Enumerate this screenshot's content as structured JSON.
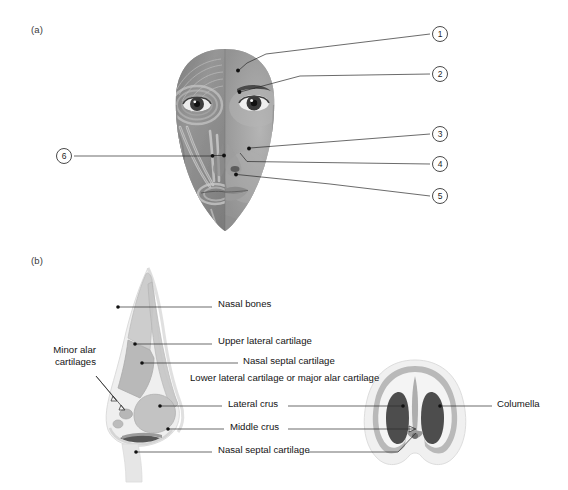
{
  "figure": {
    "panels": [
      {
        "id": "a",
        "letter": "(a)"
      },
      {
        "id": "b",
        "letter": "(b)"
      }
    ]
  },
  "panel_a": {
    "letter": "(a)",
    "description": "Anterior view of the face, left half showing facial musculature and right half showing skin surface",
    "callouts": [
      {
        "number": "1",
        "circle": {
          "x": 440,
          "y": 34
        },
        "dot": {
          "x": 237,
          "y": 70
        }
      },
      {
        "number": "2",
        "circle": {
          "x": 440,
          "y": 74
        },
        "dot": {
          "x": 238,
          "y": 92
        }
      },
      {
        "number": "3",
        "circle": {
          "x": 440,
          "y": 134
        },
        "dot": {
          "x": 243,
          "y": 149
        }
      },
      {
        "number": "4",
        "circle": {
          "x": 440,
          "y": 164
        },
        "dot": {
          "x": 240,
          "y": 162
        }
      },
      {
        "number": "5",
        "circle": {
          "x": 440,
          "y": 196
        },
        "dot": {
          "x": 233,
          "y": 175
        }
      },
      {
        "number": "6",
        "circle": {
          "x": 56,
          "y": 149
        },
        "dot": {
          "x": 211,
          "y": 156
        }
      }
    ]
  },
  "panel_b": {
    "letter": "(b)",
    "description": "Lateral (profile) view of the nasal skeleton and basal view of the nose",
    "labels": [
      {
        "id": "nasal-bones",
        "text": "Nasal bones",
        "x": 218,
        "y": 303
      },
      {
        "id": "upper-lateral-cartilage",
        "text": "Upper lateral cartilage",
        "x": 218,
        "y": 340
      },
      {
        "id": "nasal-septal-cartilage-upper",
        "text": "Nasal septal cartilage",
        "x": 243,
        "y": 360
      },
      {
        "id": "minor-alar-cartilages",
        "text": "Minor alar cartilages",
        "x": 40,
        "y": 350
      },
      {
        "id": "lower-lateral-cartilage",
        "text": "Lower lateral cartilage or major alar cartilage",
        "x": 190,
        "y": 377
      },
      {
        "id": "lateral-crus",
        "text": "Lateral crus",
        "x": 228,
        "y": 402
      },
      {
        "id": "middle-crus",
        "text": "Middle crus",
        "x": 230,
        "y": 425
      },
      {
        "id": "nasal-septal-cartilage-lower",
        "text": "Nasal septal cartilage",
        "x": 218,
        "y": 448
      },
      {
        "id": "columella",
        "text": "Columella",
        "x": 497,
        "y": 402
      }
    ]
  },
  "colors": {
    "leader_line": "#2b2b2b",
    "text": "#141414",
    "circle_border": "#4a4a4a",
    "background": "#ffffff",
    "cartilage_light": "#e3e3e3",
    "cartilage_mid": "#cfcfcf",
    "cartilage_dark": "#b4b4b4",
    "skin_outline": "#d8d8d8",
    "nostril_dark": "#4a4a4a"
  }
}
